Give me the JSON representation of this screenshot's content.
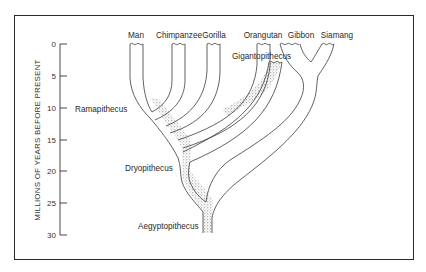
{
  "diagram": {
    "type": "phylogenetic-tree",
    "y_axis": {
      "title": "MILLIONS OF YEARS BEFORE PRESENT",
      "ticks": [
        "0",
        "5",
        "10",
        "15",
        "20",
        "25",
        "30"
      ]
    },
    "living_taxa": [
      {
        "id": "man",
        "label": "Man"
      },
      {
        "id": "chimpanzee",
        "label": "Chimpanzee"
      },
      {
        "id": "gorilla",
        "label": "Gorilla"
      },
      {
        "id": "orangutan",
        "label": "Orangutan"
      },
      {
        "id": "gibbon",
        "label": "Gibbon"
      },
      {
        "id": "siamang",
        "label": "Siamang"
      }
    ],
    "fossil_taxa": [
      {
        "id": "ramapithecus",
        "label": "Ramapithecus",
        "approx_mya": 10
      },
      {
        "id": "gigantopithecus",
        "label": "Gigantopithecus",
        "approx_mya": 3
      },
      {
        "id": "dryopithecus",
        "label": "Dryopithecus",
        "approx_mya": 20
      },
      {
        "id": "aegyptopithecus",
        "label": "Aegyptopithecus",
        "approx_mya": 29
      }
    ],
    "colors": {
      "line": "#3a3a3a",
      "stipple": "#555555",
      "frame": "#2a2a2a",
      "background": "#ffffff"
    }
  }
}
